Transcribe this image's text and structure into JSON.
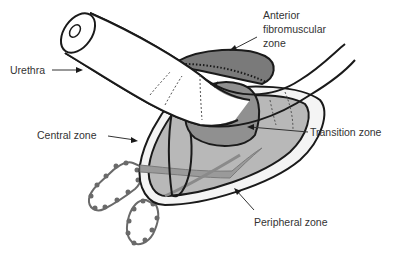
{
  "diagram": {
    "labels": {
      "urethra": "Urethra",
      "anterior_line1": "Anterior",
      "anterior_line2": "fibromuscular",
      "anterior_line3": "zone",
      "central": "Central zone",
      "transition": "Transition zone",
      "peripheral": "Peripheral zone"
    },
    "colors": {
      "outline": "#1a1a1a",
      "peripheral_fill": "#f2f2f2",
      "central_fill": "#b5b5b5",
      "transition_fill": "#8f8f8f",
      "anterior_fill": "#7a7a7a",
      "duct_fill": "#9a9a9a",
      "vesicle_stroke": "#6a6a6a",
      "label_text": "#333333"
    }
  }
}
